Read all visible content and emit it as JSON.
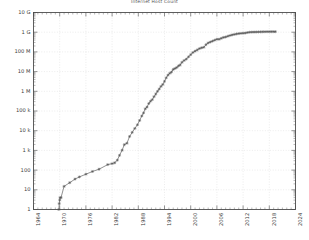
{
  "chart_data": {
    "type": "line",
    "title": "Internet Host Count",
    "xlabel": "",
    "ylabel": "",
    "yscale": "log",
    "xscale": "linear",
    "grid": true,
    "legend": "none",
    "marker": "cross",
    "line_color": "#555555",
    "grid_color": "#d8d8d8",
    "axis_color": "#4d4d4d",
    "xlim": [
      1964,
      2024
    ],
    "ylim": [
      1,
      10000000000
    ],
    "xticks": [
      1964,
      1970,
      1976,
      1982,
      1988,
      1994,
      2000,
      2006,
      2012,
      2018,
      2024
    ],
    "xticklabels": [
      "1964",
      "1970",
      "1976",
      "1982",
      "1988",
      "1994",
      "2000",
      "2006",
      "2012",
      "2018",
      "2024"
    ],
    "yticks": [
      1,
      10,
      1000,
      1000,
      100000,
      1000000,
      100000000,
      1000000000,
      10000000000
    ],
    "yticklabels": [
      "1",
      "10",
      "100",
      "1 k",
      "10 k",
      "100 k",
      "1 M",
      "10 M",
      "100 M",
      "1 G",
      "10 G"
    ],
    "ytickvalues": [
      1,
      10,
      100,
      1000,
      10000,
      100000,
      1000000,
      10000000,
      100000000,
      1000000000,
      10000000000
    ],
    "series": [
      {
        "name": "Internet hosts",
        "x": [
          1969.8,
          1969.9,
          1970.0,
          1970.1,
          1970.3,
          1971.0,
          1972.3,
          1973.5,
          1974.5,
          1976.0,
          1977.5,
          1979.0,
          1981.0,
          1982.0,
          1982.6,
          1983.2,
          1983.7,
          1984.3,
          1984.8,
          1985.4,
          1986.0,
          1986.6,
          1987.2,
          1987.8,
          1988.3,
          1988.8,
          1989.2,
          1989.6,
          1990.0,
          1990.4,
          1990.8,
          1991.2,
          1991.6,
          1992.0,
          1992.4,
          1992.8,
          1993.2,
          1993.6,
          1994.0,
          1994.4,
          1994.8,
          1995.2,
          1995.6,
          1996.0,
          1996.4,
          1996.8,
          1997.2,
          1997.6,
          1998.0,
          1998.5,
          1999.0,
          1999.5,
          2000.0,
          2000.5,
          2001.0,
          2001.5,
          2002.0,
          2002.5,
          2003.0,
          2003.5,
          2004.0,
          2004.5,
          2005.0,
          2005.5,
          2006.0,
          2006.5,
          2007.0,
          2007.5,
          2008.0,
          2008.5,
          2009.0,
          2009.5,
          2010.0,
          2010.5,
          2011.0,
          2011.5,
          2012.0,
          2012.5,
          2013.0,
          2013.5,
          2014.0,
          2014.5,
          2015.0,
          2015.5,
          2016.0,
          2016.5,
          2017.0,
          2017.5,
          2018.0,
          2018.5,
          2019.0,
          2019.4
        ],
        "y": [
          1,
          2,
          3,
          4,
          4,
          15,
          23,
          35,
          45,
          62,
          85,
          111,
          190,
          213,
          235,
          320,
          562,
          1024,
          1961,
          2308,
          5089,
          8200,
          13000,
          20000,
          33000,
          56000,
          80000,
          130000,
          159000,
          240000,
          313000,
          376000,
          535000,
          727000,
          992000,
          1313000,
          1776000,
          2217000,
          3212000,
          4852000,
          6642000,
          8200000,
          9472000,
          12881000,
          14352000,
          16146000,
          19540000,
          21819000,
          29670000,
          36739000,
          43230000,
          56218000,
          72398000,
          93047000,
          109574000,
          125888000,
          147344000,
          162128000,
          171638000,
          233101000,
          285139000,
          317646000,
          353284000,
          394992000,
          439286000,
          439286000,
          489774000,
          541677000,
          570937000,
          625226000,
          681064000,
          732740000,
          768913000,
          818374000,
          849869000,
          872000000,
          888239000,
          908585000,
          963518000,
          996230000,
          1010251000,
          1018000000,
          1022000000,
          1030000000,
          1040000000,
          1048000000,
          1055000000,
          1060000000,
          1062000000,
          1063000000,
          1064000000,
          1064000000
        ]
      }
    ]
  }
}
